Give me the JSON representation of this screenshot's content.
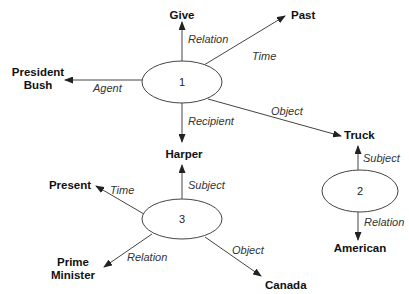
{
  "diagram": {
    "type": "semantic-network",
    "ellipses": [
      {
        "id": "1",
        "label": "1"
      },
      {
        "id": "2",
        "label": "2"
      },
      {
        "id": "3",
        "label": "3"
      }
    ],
    "nodes": {
      "give": "Give",
      "past": "Past",
      "president_line1": "President",
      "president_line2": "Bush",
      "harper": "Harper",
      "truck": "Truck",
      "american": "American",
      "present": "Present",
      "prime_line1": "Prime",
      "prime_line2": "Minister",
      "canada": "Canada"
    },
    "edges": {
      "e1_relation": "Relation",
      "e1_time": "Time",
      "e1_agent": "Agent",
      "e1_recipient": "Recipient",
      "e1_object": "Object",
      "e2_subject": "Subject",
      "e2_relation": "Relation",
      "e3_subject": "Subject",
      "e3_time": "Time",
      "e3_relation": "Relation",
      "e3_object": "Object"
    }
  }
}
